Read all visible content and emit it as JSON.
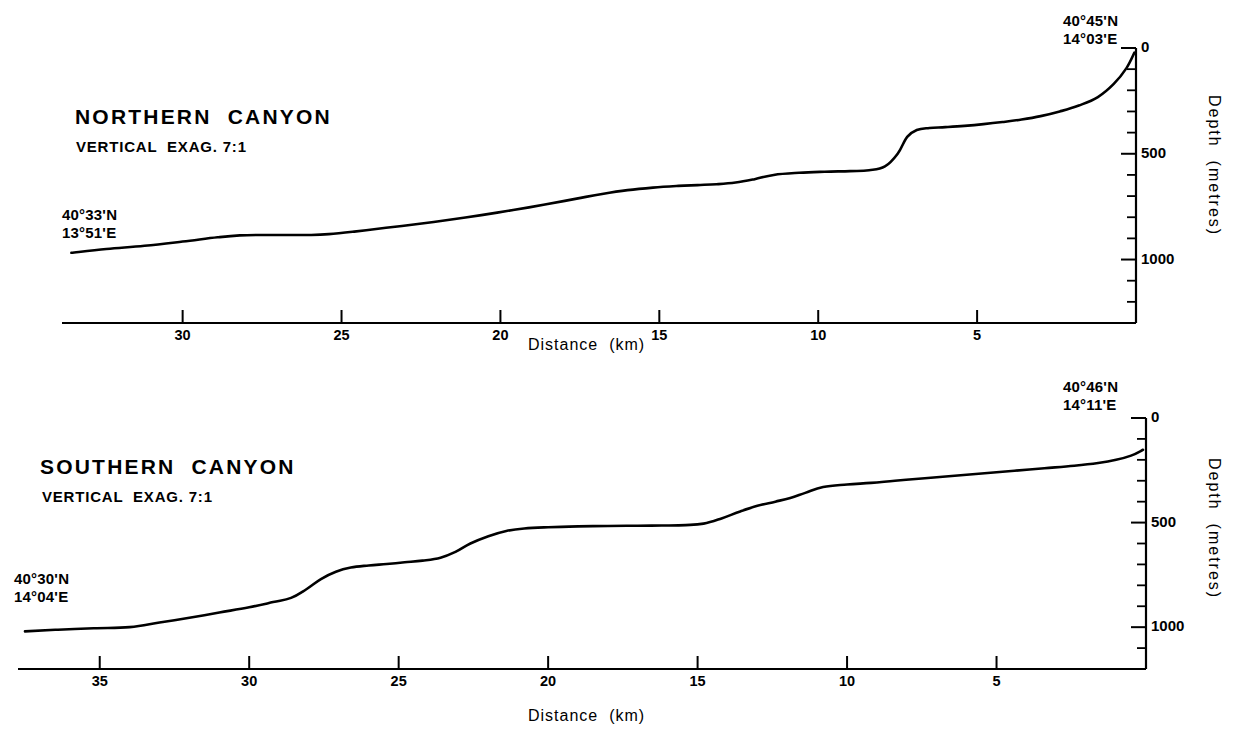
{
  "figure": {
    "type": "bathymetric-profile-figure",
    "panels": [
      "northern",
      "southern"
    ]
  },
  "chart_data": [
    {
      "type": "line",
      "title": "NORTHERN CANYON",
      "subtitle": "VERTICAL EXAG. 7:1",
      "xlabel": "Distance (km)",
      "ylabel": "Depth (metres)",
      "xlim": [
        33.5,
        0
      ],
      "ylim": [
        0,
        1300
      ],
      "y_inverted": true,
      "grid": false,
      "legend": "none",
      "xticks": [
        30,
        25,
        20,
        15,
        10,
        5
      ],
      "xtick_labels": [
        "30",
        "25",
        "20",
        "15",
        "10",
        "5"
      ],
      "yticks": [
        0,
        100,
        200,
        300,
        400,
        500,
        600,
        700,
        800,
        900,
        1000,
        1100,
        1200,
        1300
      ],
      "ytick_labels_shown": {
        "0": "0",
        "500": "500",
        "1000": "1000"
      },
      "annotations": [
        {
          "text": "40°45'N\n14°03'E",
          "position": "top-right",
          "marks": "seaward end of profile"
        },
        {
          "text": "40°33'N\n13°51'E",
          "position": "left",
          "marks": "landward/deep end of profile"
        }
      ],
      "series": [
        {
          "name": "Northern canyon thalweg depth profile",
          "x": [
            33.5,
            32.4,
            31.2,
            30.0,
            28.9,
            28.2,
            27.4,
            26.6,
            26.0,
            25.4,
            24.6,
            23.6,
            22.6,
            21.6,
            20.6,
            19.6,
            18.6,
            17.6,
            16.8,
            16.0,
            15.2,
            14.4,
            13.8,
            13.2,
            12.6,
            12.0,
            11.4,
            10.6,
            9.8,
            9.0,
            8.4,
            7.9,
            7.5,
            7.2,
            6.9,
            6.5,
            6.0,
            5.4,
            4.8,
            4.2,
            3.6,
            3.0,
            2.4,
            1.8,
            1.2,
            0.7,
            0.3,
            0.05
          ],
          "y": [
            968,
            950,
            935,
            915,
            895,
            886,
            884,
            884,
            884,
            880,
            868,
            850,
            832,
            812,
            790,
            766,
            740,
            712,
            690,
            672,
            660,
            652,
            648,
            644,
            636,
            620,
            600,
            590,
            585,
            582,
            578,
            560,
            500,
            420,
            388,
            378,
            374,
            368,
            360,
            350,
            338,
            322,
            300,
            272,
            232,
            170,
            95,
            22
          ]
        }
      ]
    },
    {
      "type": "line",
      "title": "SOUTHERN CANYON",
      "subtitle": "VERTICAL EXAG. 7:1",
      "xlabel": "Distance (km)",
      "ylabel": "Depth (metres)",
      "xlim": [
        37.5,
        0
      ],
      "ylim": [
        0,
        1300
      ],
      "y_inverted": true,
      "grid": false,
      "legend": "none",
      "xticks": [
        35,
        30,
        25,
        20,
        15,
        10,
        5
      ],
      "xtick_labels": [
        "35",
        "30",
        "25",
        "20",
        "15",
        "10",
        "5"
      ],
      "yticks": [
        0,
        100,
        200,
        300,
        400,
        500,
        600,
        700,
        800,
        900,
        1000,
        1100,
        1200,
        1300
      ],
      "ytick_labels_shown": {
        "0": "0",
        "500": "500",
        "1000": "1000"
      },
      "annotations": [
        {
          "text": "40°46'N\n14°11'E",
          "position": "top-right",
          "marks": "seaward end of profile"
        },
        {
          "text": "40°30'N\n14°04'E",
          "position": "left",
          "marks": "landward/deep end of profile"
        }
      ],
      "series": [
        {
          "name": "Southern canyon thalweg depth profile",
          "x": [
            37.5,
            36.4,
            35.2,
            34.0,
            33.0,
            32.0,
            31.0,
            30.0,
            29.2,
            28.6,
            28.1,
            27.6,
            27.1,
            26.6,
            26.0,
            25.4,
            24.8,
            24.2,
            23.6,
            23.1,
            22.6,
            22.0,
            21.4,
            20.8,
            20.0,
            19.0,
            18.0,
            17.0,
            16.2,
            15.4,
            14.8,
            14.2,
            13.6,
            13.0,
            12.4,
            11.9,
            11.4,
            10.8,
            10.0,
            9.2,
            8.4,
            7.4,
            6.4,
            5.4,
            4.4,
            3.4,
            2.4,
            1.6,
            1.0,
            0.5,
            0.1
          ],
          "y": [
            1020,
            1012,
            1005,
            1000,
            978,
            955,
            930,
            905,
            880,
            860,
            820,
            770,
            735,
            715,
            705,
            698,
            690,
            682,
            668,
            640,
            600,
            565,
            540,
            528,
            522,
            518,
            516,
            515,
            514,
            512,
            505,
            480,
            448,
            420,
            400,
            382,
            358,
            330,
            318,
            310,
            300,
            288,
            276,
            264,
            252,
            240,
            228,
            215,
            200,
            180,
            152
          ]
        }
      ]
    }
  ],
  "north": {
    "title": "NORTHERN  CANYON",
    "exag": "VERTICAL  EXAG. 7:1",
    "coord_left": [
      "40°33'N",
      "13°51'E"
    ],
    "coord_right": [
      "40°45'N",
      "14°03'E"
    ],
    "x_axis_title": "Distance  (km)",
    "y_axis_title": "Depth  (metres)",
    "xticks": [
      {
        "label": "30",
        "value": 30
      },
      {
        "label": "25",
        "value": 25
      },
      {
        "label": "20",
        "value": 20
      },
      {
        "label": "15",
        "value": 15
      },
      {
        "label": "10",
        "value": 10
      },
      {
        "label": "5",
        "value": 5
      }
    ],
    "yticks": [
      {
        "label": "0",
        "value": 0
      },
      {
        "label": "500",
        "value": 500
      },
      {
        "label": "1000",
        "value": 1000
      }
    ]
  },
  "south": {
    "title": "SOUTHERN  CANYON",
    "exag": "VERTICAL  EXAG. 7:1",
    "coord_left": [
      "40°30'N",
      "14°04'E"
    ],
    "coord_right": [
      "40°46'N",
      "14°11'E"
    ],
    "x_axis_title": "Distance  (km)",
    "y_axis_title": "Depth  (metres)",
    "xticks": [
      {
        "label": "35",
        "value": 35
      },
      {
        "label": "30",
        "value": 30
      },
      {
        "label": "25",
        "value": 25
      },
      {
        "label": "20",
        "value": 20
      },
      {
        "label": "15",
        "value": 15
      },
      {
        "label": "10",
        "value": 10
      },
      {
        "label": "5",
        "value": 5
      }
    ],
    "yticks": [
      {
        "label": "0",
        "value": 0
      },
      {
        "label": "500",
        "value": 500
      },
      {
        "label": "1000",
        "value": 1000
      }
    ]
  },
  "colors": {
    "ink": "#000000",
    "paper": "#ffffff"
  }
}
